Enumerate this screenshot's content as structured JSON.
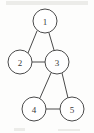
{
  "figure": {
    "title": "",
    "type": "undirected-graph-diagram",
    "width": 94,
    "height": 133,
    "background_color": "#fdfdfc",
    "stroke_color": "#4a4a4a",
    "label_color": "#3a3a3a",
    "node_fill_color": "#ffffff"
  },
  "graph": {
    "node_radius": 12,
    "nodes": [
      {
        "id": "1",
        "label": "1",
        "cx": 45,
        "cy": 21
      },
      {
        "id": "2",
        "label": "2",
        "cx": 20,
        "cy": 62
      },
      {
        "id": "3",
        "label": "3",
        "cx": 57,
        "cy": 62
      },
      {
        "id": "4",
        "label": "4",
        "cx": 34,
        "cy": 109
      },
      {
        "id": "5",
        "label": "5",
        "cx": 72,
        "cy": 109
      }
    ],
    "edges": [
      {
        "id": "edge-1-2",
        "from": "1",
        "to": "2",
        "x1": 37,
        "y1": 31,
        "x2": 28,
        "y2": 53
      },
      {
        "id": "edge-1-3",
        "from": "1",
        "to": "3",
        "x1": 49,
        "y1": 33,
        "x2": 54,
        "y2": 50
      },
      {
        "id": "edge-2-3",
        "from": "2",
        "to": "3",
        "x1": 32,
        "y1": 62,
        "x2": 45,
        "y2": 62
      },
      {
        "id": "edge-3-4",
        "from": "3",
        "to": "4",
        "x1": 51,
        "y1": 73,
        "x2": 40,
        "y2": 98
      },
      {
        "id": "edge-3-5",
        "from": "3",
        "to": "5",
        "x1": 62,
        "y1": 73,
        "x2": 68,
        "y2": 98
      },
      {
        "id": "edge-4-5",
        "from": "4",
        "to": "5",
        "x1": 46,
        "y1": 109,
        "x2": 60,
        "y2": 109
      }
    ]
  },
  "artifacts": {
    "marks": [
      {
        "id": "mark-bottom-left",
        "left": 14,
        "top": 128,
        "width": 11,
        "height": 3
      },
      {
        "id": "mark-bottom-right",
        "left": 58,
        "top": 129,
        "width": 22,
        "height": 2
      },
      {
        "id": "mark-top-band",
        "left": 6,
        "top": 1,
        "width": 82,
        "height": 4
      }
    ]
  }
}
